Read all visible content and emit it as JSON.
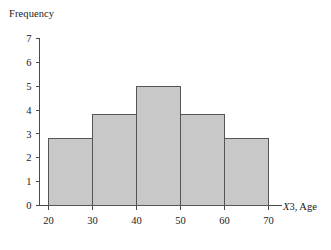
{
  "chart_data": {
    "type": "bar",
    "title": "",
    "subtitle": "",
    "ylabel": "Frequency",
    "xlabel": "X3, Age",
    "xlabel_italic_part": "X",
    "xlabel_rest": "3, Age",
    "categories": [
      "20-30",
      "30-40",
      "40-50",
      "50-60",
      "60-70"
    ],
    "bin_edges": [
      20,
      30,
      40,
      50,
      60,
      70
    ],
    "values": [
      2.8,
      3.8,
      5.0,
      3.8,
      2.8
    ],
    "xticks": [
      "20",
      "30",
      "40",
      "50",
      "60",
      "70"
    ],
    "yticks": [
      "0",
      "1",
      "2",
      "3",
      "4",
      "5",
      "6",
      "7"
    ],
    "xlim": [
      20,
      70
    ],
    "ylim": [
      0,
      7
    ],
    "grid": false,
    "legend": null,
    "bar_fill_color": "#c8c8c8",
    "bar_edge_color": "#555555",
    "axis_color": "#4a4a4a",
    "background_color": "#ffffff"
  }
}
